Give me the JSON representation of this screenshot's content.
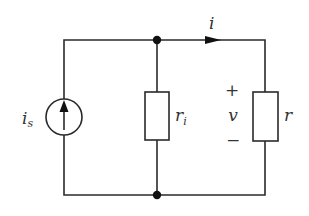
{
  "diagram": {
    "type": "circuit-schematic",
    "components": {
      "current_source": {
        "label": "i",
        "subscript": "s",
        "direction": "up"
      },
      "internal_resistor": {
        "label": "r",
        "subscript": "i"
      },
      "load_resistor": {
        "label": "r"
      }
    },
    "current": {
      "label": "i",
      "direction": "right"
    },
    "voltage": {
      "label": "v",
      "plus": "+",
      "minus": "−"
    },
    "nodes": [
      "top-junction",
      "bottom-junction"
    ],
    "colors": {
      "wire": "#2a2a2a",
      "node": "#111111",
      "text": "#333333",
      "background": "#ffffff"
    }
  }
}
